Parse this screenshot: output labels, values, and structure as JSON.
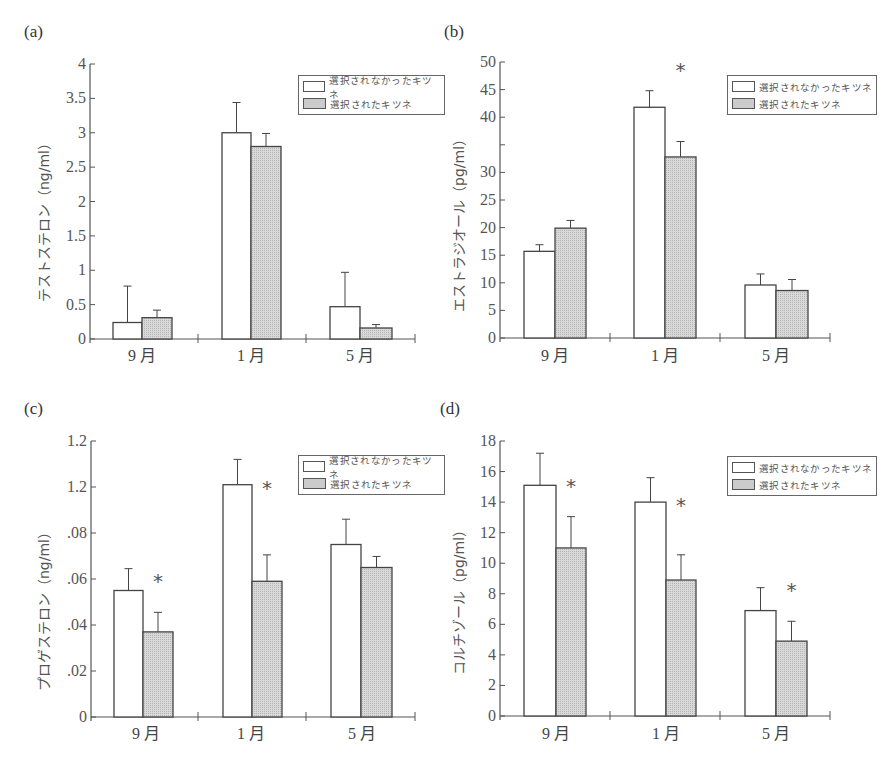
{
  "colors": {
    "axis": "#555555",
    "bar_outline": "#444444",
    "bar_white": "#ffffff",
    "bar_grey": "#d9d9d9",
    "text": "#444444"
  },
  "legend": {
    "items": [
      {
        "label": "選択されなかったキツネ",
        "style": "white"
      },
      {
        "label": "選択されたキツネ",
        "style": "grey"
      }
    ]
  },
  "chart_data": [
    {
      "id": "a",
      "panel_label": "(a)",
      "type": "bar",
      "title": "",
      "ylabel": "テストステロン（ng/ml）",
      "xlabel": "",
      "categories": [
        "9月",
        "1月",
        "5月"
      ],
      "ylim": [
        0,
        4
      ],
      "y_ticks": [
        0,
        0.5,
        1,
        1.5,
        2,
        2.5,
        3,
        3.5,
        4
      ],
      "y_tick_labels": [
        "0",
        "0.5",
        "1",
        "1.5",
        "2",
        "2.5",
        "3",
        "3.5",
        "4"
      ],
      "series": [
        {
          "name": "選択されなかったキツネ",
          "values": [
            0.24,
            3.0,
            0.47
          ],
          "errors": [
            0.53,
            0.44,
            0.5
          ]
        },
        {
          "name": "選択されたキツネ",
          "values": [
            0.31,
            2.8,
            0.16
          ],
          "errors": [
            0.11,
            0.19,
            0.05
          ]
        }
      ],
      "significance": [],
      "legend_position": "upper right",
      "grid": false
    },
    {
      "id": "b",
      "panel_label": "(b)",
      "type": "bar",
      "title": "",
      "ylabel": "エストラジオール（pg/ml）",
      "xlabel": "",
      "categories": [
        "9月",
        "1月",
        "5月"
      ],
      "ylim": [
        0,
        50
      ],
      "y_ticks": [
        0,
        5,
        10,
        15,
        20,
        25,
        30,
        35,
        40,
        45,
        50
      ],
      "y_tick_labels": [
        "0",
        "5",
        "10",
        "15",
        "20",
        "25",
        "30",
        "",
        "40",
        "45",
        "50"
      ],
      "y_tick_label_note": "printed labels read 50,45,40,30,25,20,15,10,5,0 (offset from ticks)",
      "series": [
        {
          "name": "選択されなかったキツネ",
          "values": [
            15.7,
            41.8,
            9.6
          ],
          "errors": [
            1.2,
            3.0,
            2.0
          ]
        },
        {
          "name": "選択されたキツネ",
          "values": [
            19.9,
            32.8,
            8.6
          ],
          "errors": [
            1.4,
            2.8,
            2.0
          ]
        }
      ],
      "significance": [
        {
          "category": "1月",
          "label": "*"
        }
      ],
      "legend_position": "upper right",
      "grid": false
    },
    {
      "id": "c",
      "panel_label": "(c)",
      "type": "bar",
      "title": "",
      "ylabel": "プロゲステロン（ng/ml）",
      "xlabel": "",
      "categories": [
        "9月",
        "1月",
        "5月"
      ],
      "ylim": [
        0,
        0.12
      ],
      "y_ticks": [
        0,
        0.02,
        0.04,
        0.06,
        0.08,
        0.1,
        0.12
      ],
      "y_tick_labels": [
        "0",
        ".02",
        ".04",
        ".06",
        ".08",
        "1.2",
        "1.2"
      ],
      "series": [
        {
          "name": "選択されなかったキツネ",
          "values": [
            0.055,
            0.101,
            0.075
          ],
          "errors": [
            0.0095,
            0.011,
            0.011
          ]
        },
        {
          "name": "選択されたキツネ",
          "values": [
            0.037,
            0.059,
            0.065
          ],
          "errors": [
            0.0085,
            0.0115,
            0.0048
          ]
        }
      ],
      "significance": [
        {
          "category": "9月",
          "label": "*"
        },
        {
          "category": "1月",
          "label": "*"
        }
      ],
      "legend_position": "upper right",
      "grid": false
    },
    {
      "id": "d",
      "panel_label": "(d)",
      "type": "bar",
      "title": "",
      "ylabel": "コルチゾール（pg/ml）",
      "xlabel": "",
      "categories": [
        "9月",
        "1月",
        "5月"
      ],
      "ylim": [
        0,
        18
      ],
      "y_ticks": [
        0,
        2,
        4,
        6,
        8,
        10,
        12,
        14,
        16,
        18
      ],
      "y_tick_labels": [
        "0",
        "2",
        "4",
        "6",
        "8",
        "10",
        "12",
        "14",
        "16",
        "18"
      ],
      "series": [
        {
          "name": "選択されなかったキツネ",
          "values": [
            15.1,
            14.0,
            6.9
          ],
          "errors": [
            2.1,
            1.6,
            1.5
          ]
        },
        {
          "name": "選択されたキツネ",
          "values": [
            11.0,
            8.9,
            4.9
          ],
          "errors": [
            2.05,
            1.65,
            1.3
          ]
        }
      ],
      "significance": [
        {
          "category": "9月",
          "label": "*"
        },
        {
          "category": "1月",
          "label": "*"
        },
        {
          "category": "5月",
          "label": "*"
        }
      ],
      "legend_position": "upper right",
      "grid": false
    }
  ]
}
